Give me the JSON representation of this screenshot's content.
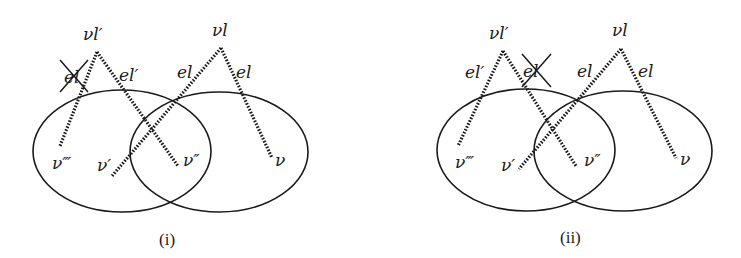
{
  "panels": [
    {
      "caption": "(i)",
      "labels": {
        "vl_prime": "νl′",
        "vl": "νl",
        "el_crossed": "el",
        "el_prime_right": "el′",
        "el_left": "el",
        "el_right": "el",
        "v_triple": "ν‴",
        "v_prime": "ν′",
        "v_double": "ν″",
        "v": "ν"
      },
      "crossed_out_edge": "el (left edge of νl′)"
    },
    {
      "caption": "(ii)",
      "labels": {
        "vl_prime": "νl′",
        "vl": "νl",
        "el_prime_left": "el′",
        "el_crossed": "el",
        "el_left": "el",
        "el_right": "el",
        "v_triple": "ν‴",
        "v_prime": "ν′",
        "v_double": "ν″",
        "v": "ν"
      },
      "crossed_out_edge": "el (right edge of νl′)"
    }
  ],
  "colors": {
    "ink": "#1a1a1a",
    "background": "#ffffff"
  }
}
